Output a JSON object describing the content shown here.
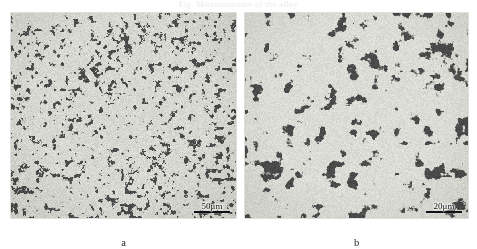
{
  "figure": {
    "clipped_header_text": "Fig. Microstructure of the alloy",
    "background_color": "#ffffff",
    "panel_count": 2
  },
  "panels": [
    {
      "id": "a",
      "caption": "a",
      "scalebar": {
        "label": "50μm",
        "value": 50,
        "unit": "μm",
        "position": "bottom-right"
      },
      "image": {
        "type": "micrograph",
        "description": "fine two-phase grayscale metallographic microstructure",
        "dark_phase_color": "#4a4a4a",
        "light_phase_color": "#d8d8d2",
        "feature_scale": "fine"
      }
    },
    {
      "id": "b",
      "caption": "b",
      "scalebar": {
        "label": "20μm",
        "value": 20,
        "unit": "μm",
        "position": "bottom-right"
      },
      "image": {
        "type": "micrograph",
        "description": "coarser two-phase grayscale metallographic microstructure",
        "dark_phase_color": "#4a4a4a",
        "light_phase_color": "#dcdcd6",
        "feature_scale": "coarse"
      }
    }
  ]
}
